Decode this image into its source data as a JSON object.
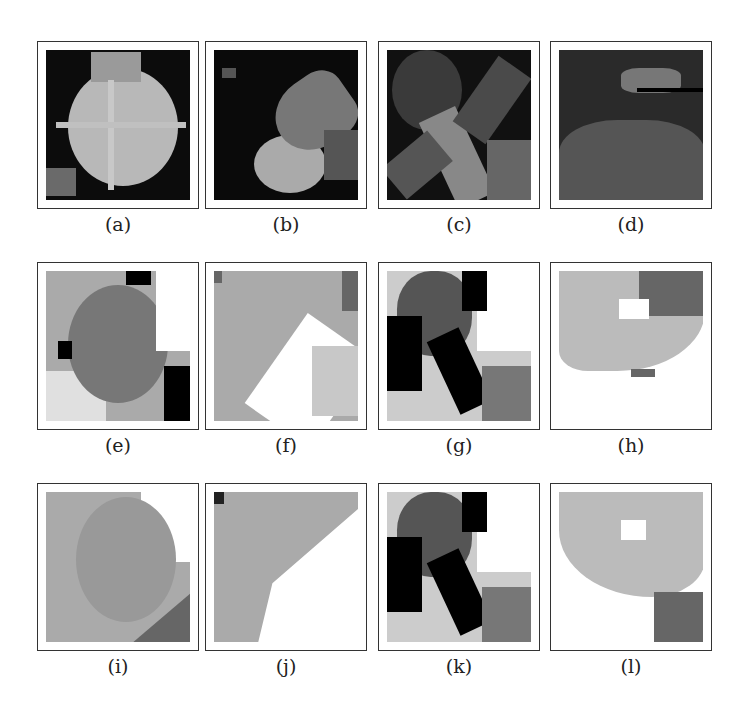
{
  "figure": {
    "panels": [
      {
        "label": "(a)",
        "row": 0,
        "col": 0,
        "kind": "original",
        "content": "spiky flower on dark background"
      },
      {
        "label": "(b)",
        "row": 0,
        "col": 1,
        "kind": "original",
        "content": "bright object on dark background"
      },
      {
        "label": "(c)",
        "row": 0,
        "col": 2,
        "kind": "original",
        "content": "crossed objects"
      },
      {
        "label": "(d)",
        "row": 0,
        "col": 3,
        "kind": "original",
        "content": "dark textured surface"
      },
      {
        "label": "(e)",
        "row": 1,
        "col": 0,
        "kind": "segmentation"
      },
      {
        "label": "(f)",
        "row": 1,
        "col": 1,
        "kind": "segmentation"
      },
      {
        "label": "(g)",
        "row": 1,
        "col": 2,
        "kind": "segmentation"
      },
      {
        "label": "(h)",
        "row": 1,
        "col": 3,
        "kind": "segmentation"
      },
      {
        "label": "(i)",
        "row": 2,
        "col": 0,
        "kind": "segmentation"
      },
      {
        "label": "(j)",
        "row": 2,
        "col": 1,
        "kind": "segmentation"
      },
      {
        "label": "(k)",
        "row": 2,
        "col": 2,
        "kind": "segmentation"
      },
      {
        "label": "(l)",
        "row": 2,
        "col": 3,
        "kind": "segmentation"
      }
    ]
  }
}
